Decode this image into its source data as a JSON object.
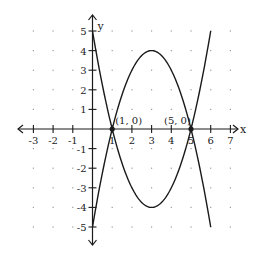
{
  "chart_data": {
    "type": "line",
    "title": "",
    "xlabel": "x",
    "ylabel": "y",
    "xlim": [
      -3.5,
      7.3
    ],
    "ylim": [
      -5.5,
      5.5
    ],
    "grid": "dots",
    "x_ticks": [
      -3,
      -2,
      -1,
      1,
      2,
      3,
      4,
      5,
      6,
      7
    ],
    "y_ticks": [
      -5,
      -4,
      -3,
      -2,
      -1,
      1,
      2,
      3,
      4,
      5
    ],
    "x_tick_labels": [
      "-3",
      "-2",
      "-1",
      "1",
      "2",
      "3",
      "4",
      "5",
      "6",
      "7"
    ],
    "y_tick_labels": [
      "-5",
      "-4",
      "-3",
      "-2",
      "-1",
      "1",
      "2",
      "3",
      "4",
      "5"
    ],
    "series": [
      {
        "name": "upward parabola",
        "equation": "y = x^2 - 6x + 5",
        "x": [
          0,
          0.5,
          1,
          1.5,
          2,
          2.5,
          3,
          3.5,
          4,
          4.5,
          5,
          5.5,
          6
        ],
        "y": [
          5,
          2.25,
          0,
          -1.75,
          -3,
          -3.75,
          -4,
          -3.75,
          -3,
          -1.75,
          0,
          2.25,
          5
        ]
      },
      {
        "name": "downward parabola",
        "equation": "y = -x^2 + 6x - 5",
        "x": [
          0,
          0.5,
          1,
          1.5,
          2,
          2.5,
          3,
          3.5,
          4,
          4.5,
          5,
          5.5,
          6
        ],
        "y": [
          -5,
          -2.25,
          0,
          1.75,
          3,
          3.75,
          4,
          3.75,
          3,
          1.75,
          0,
          -2.25,
          -5
        ]
      }
    ],
    "annotations": [
      {
        "text": "(1, 0)",
        "x": 1,
        "y": 0
      },
      {
        "text": "(5, 0)",
        "x": 5,
        "y": 0
      }
    ]
  },
  "labels": {
    "x_axis": "x",
    "y_axis": "y",
    "point1": "(1, 0)",
    "point2": "(5, 0)"
  },
  "colors": {
    "curve": "#1a1a1a",
    "axis": "#1a1a1a",
    "grid_dot": "#9a9a9a"
  }
}
